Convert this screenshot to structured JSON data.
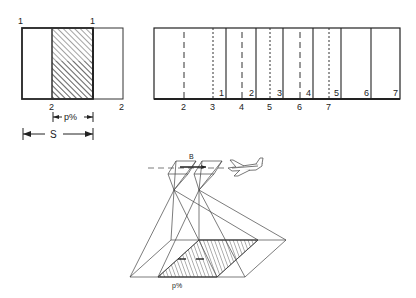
{
  "figure": {
    "panel_single_overlap": {
      "corner_labels_top": [
        "1",
        "1"
      ],
      "corner_labels_bottom": [
        "2",
        "2"
      ],
      "overlap_label": "p%",
      "spacing_label": "S"
    },
    "panel_strip": {
      "bottom_outer_labels": [
        "2",
        "3",
        "4",
        "5",
        "6",
        "7"
      ],
      "inner_corner_labels": [
        "1",
        "2",
        "3",
        "4",
        "5",
        "6",
        "7"
      ]
    },
    "panel_aircraft": {
      "base_label": "B",
      "overlap_label": "p%",
      "aircraft_icon": "airplane"
    }
  }
}
